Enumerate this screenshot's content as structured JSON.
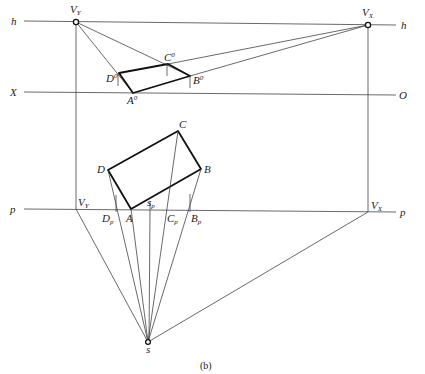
{
  "figure": {
    "caption": "(b)",
    "lines": {
      "horizon": {
        "label_left": "h",
        "label_right": "h"
      },
      "ground": {
        "label_left": "X",
        "label_right": "O"
      },
      "picture_plane": {
        "label_left": "p",
        "label_right": "p"
      }
    },
    "vanishing_points": {
      "vy": {
        "main": "V",
        "sub": "Y"
      },
      "vx": {
        "main": "V",
        "sub": "X"
      },
      "vy_plan": {
        "main": "V",
        "sub": "Y"
      },
      "vx_plan": {
        "main": "V",
        "sub": "X"
      }
    },
    "perspective_points": {
      "a0": {
        "main": "A",
        "sup": "0"
      },
      "b0": {
        "main": "B",
        "sup": "0"
      },
      "c0": {
        "main": "C",
        "sup": "0"
      },
      "d0": {
        "main": "D",
        "sup": "0"
      }
    },
    "plan_points": {
      "a": "A",
      "b": "B",
      "c": "C",
      "d": "D"
    },
    "picture_plane_points": {
      "dp": {
        "main": "D",
        "sub": "p"
      },
      "cp": {
        "main": "C",
        "sub": "p"
      },
      "bp": {
        "main": "B",
        "sub": "p"
      },
      "sp": {
        "main": "s",
        "sub": "p"
      }
    },
    "station_point": "s"
  }
}
